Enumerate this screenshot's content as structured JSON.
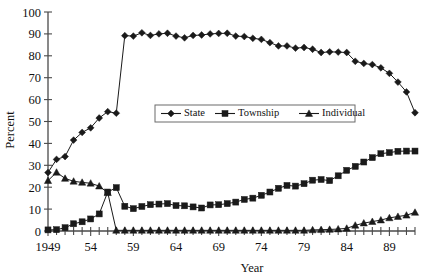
{
  "chart_data": {
    "type": "line",
    "title": "",
    "xlabel": "Year",
    "ylabel": "Percent",
    "ylim": [
      0,
      100
    ],
    "xlim": [
      1949,
      1992
    ],
    "ytick_labels": [
      "0",
      "10",
      "20",
      "30",
      "40",
      "50",
      "60",
      "70",
      "80",
      "90",
      "100"
    ],
    "ytick_values": [
      0,
      10,
      20,
      30,
      40,
      50,
      60,
      70,
      80,
      90,
      100
    ],
    "xtick_labels": [
      "1949",
      "54",
      "59",
      "64",
      "69",
      "74",
      "79",
      "84",
      "89"
    ],
    "xtick_values": [
      1949,
      1954,
      1959,
      1964,
      1969,
      1974,
      1979,
      1984,
      1989
    ],
    "grid": false,
    "legend_position": "inside-center",
    "x": [
      1949,
      1950,
      1951,
      1952,
      1953,
      1954,
      1955,
      1956,
      1957,
      1958,
      1959,
      1960,
      1961,
      1962,
      1963,
      1964,
      1965,
      1966,
      1967,
      1968,
      1969,
      1970,
      1971,
      1972,
      1973,
      1974,
      1975,
      1976,
      1977,
      1978,
      1979,
      1980,
      1981,
      1982,
      1983,
      1984,
      1985,
      1986,
      1987,
      1988,
      1989,
      1990,
      1991,
      1992
    ],
    "series": [
      {
        "name": "State",
        "marker": "diamond",
        "values": [
          26.7,
          32.7,
          34.0,
          41.5,
          45.0,
          47.1,
          51.6,
          54.5,
          53.8,
          89.2,
          89.0,
          90.5,
          89.3,
          90.0,
          90.3,
          89.0,
          88.2,
          89.3,
          89.5,
          90.0,
          90.2,
          90.3,
          89.0,
          88.8,
          88.0,
          87.5,
          86.0,
          84.5,
          84.5,
          83.5,
          83.8,
          83.0,
          81.5,
          81.8,
          81.7,
          81.5,
          77.5,
          76.5,
          76.0,
          74.5,
          72.0,
          68.0,
          63.5,
          54.0
        ]
      },
      {
        "name": "Township",
        "marker": "square",
        "values": [
          0.5,
          0.6,
          1.5,
          3.3,
          4.2,
          5.5,
          7.8,
          17.8,
          19.8,
          11.3,
          10.2,
          11.2,
          12.0,
          12.3,
          12.5,
          11.6,
          11.5,
          11.0,
          10.5,
          11.9,
          12.0,
          12.5,
          13.2,
          14.4,
          15.0,
          16.3,
          17.8,
          19.5,
          20.8,
          20.5,
          21.6,
          23.2,
          23.5,
          23.0,
          25.2,
          27.7,
          29.5,
          31.5,
          33.5,
          35.3,
          35.8,
          36.4,
          36.5,
          36.5
        ]
      },
      {
        "name": "Individual",
        "marker": "triangle",
        "values": [
          23.0,
          26.8,
          24.0,
          22.7,
          22.2,
          21.8,
          20.5,
          17.5,
          0.3,
          0.3,
          0.3,
          0.3,
          0.3,
          0.3,
          0.3,
          0.3,
          0.3,
          0.3,
          0.3,
          0.3,
          0.3,
          0.3,
          0.3,
          0.3,
          0.3,
          0.3,
          0.3,
          0.3,
          0.3,
          0.3,
          0.3,
          0.5,
          0.6,
          0.7,
          0.9,
          1.2,
          2.6,
          3.6,
          4.3,
          5.0,
          6.0,
          6.6,
          7.2,
          8.5
        ]
      }
    ]
  }
}
